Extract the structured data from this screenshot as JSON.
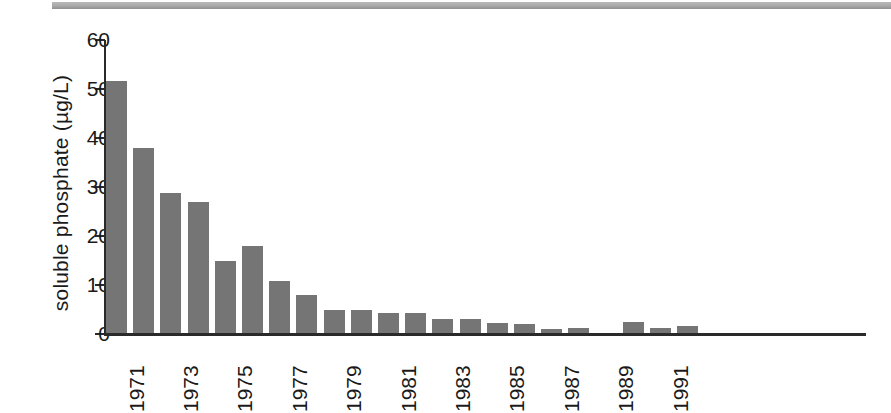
{
  "chart_data": {
    "type": "bar",
    "title": "",
    "subtitle": "",
    "xlabel": "",
    "ylabel": "soluble phosphate (µg/L)",
    "ylim": [
      0,
      60
    ],
    "yticks": [
      0,
      10,
      20,
      30,
      40,
      50,
      60
    ],
    "ytick_labels": [
      "0",
      "10",
      "20",
      "30",
      "40",
      "50",
      "60"
    ],
    "grid": false,
    "legend": null,
    "bar_color": "#757575",
    "axis_color": "#2a2a2a",
    "xtick_labels": [
      "1971",
      "1973",
      "1975",
      "1977",
      "1979",
      "1981",
      "1983",
      "1985",
      "1987",
      "1989",
      "1991"
    ],
    "categories": [
      "1971",
      "1972",
      "1973",
      "1974",
      "1975",
      "1976",
      "1977",
      "1978",
      "1979",
      "1980",
      "1981",
      "1982",
      "1983",
      "1984",
      "1985",
      "1986",
      "1987",
      "1988",
      "1989",
      "1990",
      "1991",
      "1992"
    ],
    "values": [
      51.7,
      37.9,
      28.7,
      27.0,
      14.9,
      18.0,
      10.8,
      8.0,
      5.0,
      5.0,
      4.2,
      4.2,
      3.1,
      3.1,
      2.2,
      2.0,
      1.0,
      1.3,
      0,
      2.4,
      1.3,
      1.7
    ]
  },
  "figure": {
    "background": "#ffffff",
    "scan_strip_color": "#a9a9a9"
  }
}
